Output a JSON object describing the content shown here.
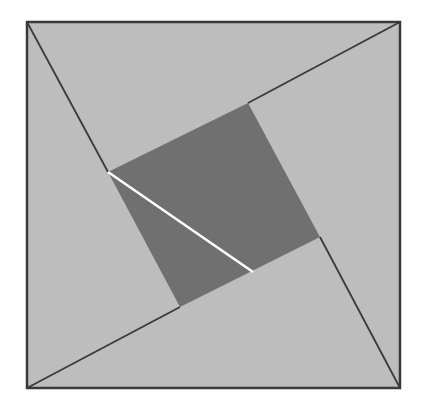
{
  "diagram": {
    "type": "geometric-figure",
    "colors": {
      "outer_fill": "#bdbdbd",
      "inner_fill": "#707070",
      "stroke": "#3a3a3a",
      "highlight_line": "#ffffff",
      "background": "#ffffff"
    },
    "outer_square": [
      [
        27,
        22
      ],
      [
        400,
        22
      ],
      [
        400,
        388
      ],
      [
        27,
        388
      ]
    ],
    "inner_square": [
      [
        108,
        172
      ],
      [
        248,
        103
      ],
      [
        320,
        237
      ],
      [
        180,
        307
      ]
    ],
    "lines": [
      {
        "from": [
          27,
          22
        ],
        "to": [
          108,
          172
        ]
      },
      {
        "from": [
          400,
          22
        ],
        "to": [
          248,
          103
        ]
      },
      {
        "from": [
          400,
          388
        ],
        "to": [
          320,
          237
        ]
      },
      {
        "from": [
          27,
          388
        ],
        "to": [
          180,
          307
        ]
      }
    ],
    "white_segment": {
      "from": [
        108,
        172
      ],
      "to": [
        253,
        272
      ]
    }
  }
}
